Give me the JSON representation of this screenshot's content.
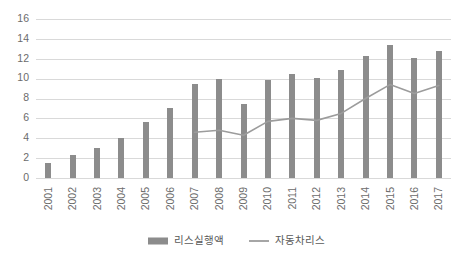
{
  "chart_data": {
    "type": "bar",
    "title": "",
    "subtitle": "",
    "xlabel": "",
    "ylabel": "",
    "categories": [
      "2001",
      "2002",
      "2003",
      "2004",
      "2005",
      "2006",
      "2007",
      "2008",
      "2009",
      "2010",
      "2011",
      "2012",
      "2013",
      "2014",
      "2015",
      "2016",
      "2017"
    ],
    "ylim": [
      0,
      16
    ],
    "ytick_step": 2,
    "yticks": [
      "0",
      "2",
      "4",
      "6",
      "8",
      "10",
      "12",
      "14",
      "16"
    ],
    "grid": true,
    "legend_position": "bottom-center",
    "series": [
      {
        "name": "리스실행액",
        "type": "bar",
        "color": "#8c8c8c",
        "values": [
          1.5,
          2.3,
          3.0,
          4.0,
          5.6,
          7.0,
          9.5,
          10.0,
          7.4,
          9.9,
          10.5,
          10.1,
          10.9,
          12.3,
          13.4,
          12.1,
          12.8
        ]
      },
      {
        "name": "자동차리스",
        "type": "line",
        "color": "#9c9c9c",
        "values": [
          null,
          null,
          null,
          null,
          null,
          null,
          4.6,
          4.8,
          4.3,
          5.7,
          6.0,
          5.8,
          6.5,
          8.0,
          9.4,
          8.5,
          9.3
        ]
      }
    ]
  },
  "legend": {
    "items": [
      {
        "label": "리스실행액",
        "marker": "bar-swatch",
        "color": "#8c8c8c"
      },
      {
        "label": "자동차리스",
        "marker": "line-swatch",
        "color": "#9c9c9c"
      }
    ]
  },
  "colors": {
    "background": "#ffffff",
    "gridline": "#d9d9d9",
    "bar": "#8c8c8c",
    "line": "#9c9c9c",
    "tick_text": "#6b6b6b",
    "legend_text": "#595959"
  }
}
